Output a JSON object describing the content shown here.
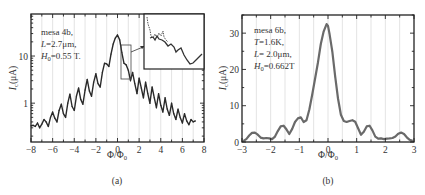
{
  "chart_data": [
    {
      "id": "a",
      "type": "line",
      "panel_label": "(a)",
      "xlabel": "Φ/Φ₀",
      "ylabel": "I_c(μA)",
      "ylabel_main": "I",
      "ylabel_sub": "c",
      "ylabel_rest": "(μA)",
      "yscale": "log",
      "xlim": [
        -8,
        8
      ],
      "ylim": [
        0.15,
        78
      ],
      "xticks": [
        -8,
        -6,
        -4,
        -2,
        0,
        2,
        4,
        6,
        8
      ],
      "xtick_labels": [
        "−8",
        "−6",
        "−4",
        "−2",
        "0",
        "2",
        "4",
        "6",
        "8"
      ],
      "yticks": [
        1,
        10
      ],
      "ytick_labels": [
        "1",
        "10"
      ],
      "grid": "vertical",
      "annotation": {
        "line1": "mesa 4b,",
        "line2_var": "L",
        "line2_rest": "=2.7μm,",
        "line3_var": "H",
        "line3_sub": "0",
        "line3_rest": "=0.55 T."
      },
      "inset": {
        "present": true,
        "zoom_region_x": [
          0.5,
          1.3
        ],
        "zoom_region_y": [
          2.4,
          8.5
        ]
      },
      "series": [
        {
          "name": "Ic",
          "x": [
            -8.0,
            -7.8,
            -7.6,
            -7.4,
            -7.2,
            -7.0,
            -6.8,
            -6.6,
            -6.4,
            -6.2,
            -6.0,
            -5.8,
            -5.6,
            -5.4,
            -5.2,
            -5.0,
            -4.8,
            -4.6,
            -4.4,
            -4.2,
            -4.0,
            -3.8,
            -3.6,
            -3.4,
            -3.2,
            -3.0,
            -2.8,
            -2.6,
            -2.4,
            -2.2,
            -2.0,
            -1.8,
            -1.6,
            -1.4,
            -1.2,
            -1.0,
            -0.8,
            -0.6,
            -0.4,
            -0.2,
            0.0,
            0.2,
            0.4,
            0.6,
            0.8,
            1.0,
            1.2,
            1.4,
            1.6,
            1.8,
            2.0,
            2.2,
            2.4,
            2.6,
            2.8,
            3.0,
            3.2,
            3.4,
            3.6,
            3.8,
            4.0,
            4.2,
            4.4,
            4.6,
            4.8,
            5.0,
            5.2,
            5.4,
            5.6,
            5.8,
            6.0,
            6.2,
            6.4,
            6.6,
            6.8,
            7.0,
            7.2
          ],
          "y": [
            0.33,
            0.34,
            0.32,
            0.38,
            0.3,
            0.36,
            0.45,
            0.4,
            0.32,
            0.5,
            0.65,
            0.48,
            0.4,
            0.7,
            0.95,
            0.6,
            0.5,
            1.0,
            1.55,
            0.85,
            0.7,
            1.4,
            2.1,
            1.2,
            0.95,
            1.9,
            3.2,
            1.8,
            1.4,
            2.8,
            4.2,
            2.6,
            2.2,
            4.5,
            7.0,
            6.8,
            6.0,
            11.0,
            18.0,
            24.0,
            28.0,
            22.0,
            12.0,
            7.0,
            6.5,
            5.0,
            3.0,
            4.5,
            2.6,
            1.6,
            3.4,
            2.1,
            1.3,
            2.8,
            1.6,
            1.0,
            2.2,
            1.3,
            0.8,
            1.6,
            0.9,
            0.65,
            1.3,
            0.75,
            0.55,
            1.0,
            0.6,
            0.45,
            0.75,
            0.5,
            0.38,
            0.6,
            0.42,
            0.35,
            0.45,
            0.4,
            0.42
          ]
        }
      ]
    },
    {
      "id": "b",
      "type": "line",
      "panel_label": "(b)",
      "xlabel": "Φ/Φ₀",
      "ylabel": "I_c(μA)",
      "ylabel_main": "I",
      "ylabel_sub": "c",
      "ylabel_rest": "(μA)",
      "yscale": "linear",
      "xlim": [
        -3,
        3
      ],
      "ylim": [
        0,
        35
      ],
      "xticks": [
        -3,
        -2,
        -1,
        0,
        1,
        2,
        3
      ],
      "xtick_labels": [
        "−3",
        "−2",
        "−1",
        "0",
        "1",
        "2",
        "3"
      ],
      "yticks": [
        0,
        10,
        20,
        30
      ],
      "ytick_labels": [
        "0",
        "10",
        "20",
        "30"
      ],
      "grid": "vertical",
      "annotation": {
        "line1": "mesa 6b,",
        "line2_var": "T",
        "line2_rest": "=1.6K,",
        "line3_var": "L",
        "line3_rest": "= 2.0μm,",
        "line4_var": "H",
        "line4_sub": "0",
        "line4_rest": "=0.662T"
      },
      "series": [
        {
          "name": "Ic",
          "x": [
            -2.95,
            -2.85,
            -2.75,
            -2.65,
            -2.55,
            -2.45,
            -2.35,
            -2.25,
            -2.15,
            -2.05,
            -1.95,
            -1.85,
            -1.75,
            -1.65,
            -1.55,
            -1.45,
            -1.35,
            -1.25,
            -1.15,
            -1.05,
            -0.95,
            -0.85,
            -0.75,
            -0.65,
            -0.55,
            -0.45,
            -0.35,
            -0.25,
            -0.15,
            -0.05,
            0.0,
            0.05,
            0.15,
            0.25,
            0.35,
            0.45,
            0.55,
            0.65,
            0.75,
            0.85,
            0.95,
            1.05,
            1.15,
            1.25,
            1.35,
            1.45,
            1.55,
            1.65,
            1.75,
            1.85,
            1.95,
            2.05,
            2.15,
            2.25,
            2.35,
            2.45,
            2.55,
            2.65,
            2.75,
            2.85,
            2.95
          ],
          "y": [
            0.3,
            0.8,
            1.8,
            2.5,
            2.6,
            2.0,
            1.2,
            1.0,
            1.1,
            1.0,
            0.8,
            1.5,
            3.0,
            4.3,
            4.5,
            3.5,
            2.2,
            3.6,
            5.5,
            6.5,
            6.8,
            5.5,
            6.0,
            9.0,
            13.0,
            17.5,
            22.0,
            27.0,
            30.5,
            32.5,
            32.0,
            30.0,
            25.0,
            18.0,
            12.0,
            7.5,
            5.8,
            5.5,
            5.8,
            6.0,
            5.6,
            3.8,
            2.0,
            2.8,
            4.3,
            4.5,
            3.2,
            1.5,
            0.9,
            1.0,
            0.8,
            0.9,
            1.0,
            1.1,
            1.5,
            2.3,
            2.6,
            2.2,
            1.3,
            0.6,
            0.3
          ]
        }
      ]
    }
  ]
}
